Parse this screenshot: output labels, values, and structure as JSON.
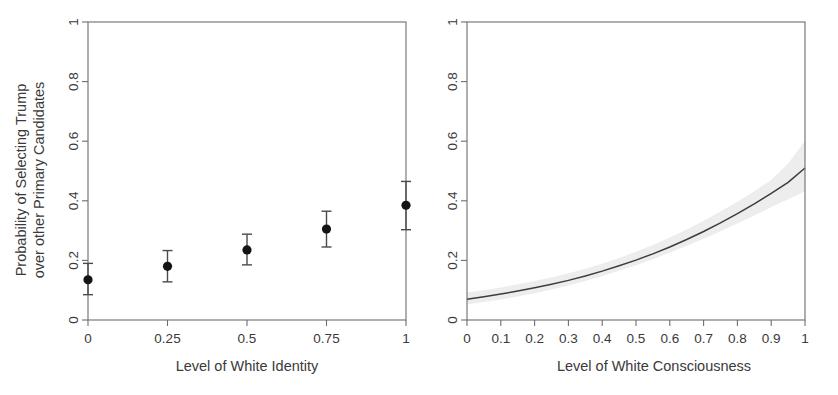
{
  "figure": {
    "panel_count": 2,
    "background_color": "#ffffff"
  },
  "chart_data": [
    {
      "id": "left-panel",
      "type": "scatter",
      "title": "",
      "xlabel": "Level of White Identity",
      "ylabel": "Probability of Selecting Trump over other Primary Candidates",
      "ylabel_line1": "Probability of Selecting Trump",
      "ylabel_line2": "over other Primary Candidates",
      "xlim": [
        0,
        1
      ],
      "ylim": [
        0,
        1
      ],
      "grid": false,
      "legend": "none",
      "xtick_labels": [
        "0",
        "0.25",
        "0.5",
        "0.75",
        "1"
      ],
      "xtick_values": [
        0,
        0.25,
        0.5,
        0.75,
        1
      ],
      "ytick_labels": [
        "0",
        "0.2",
        "0.4",
        "0.6",
        "0.8",
        "1"
      ],
      "ytick_values": [
        0,
        0.2,
        0.4,
        0.6,
        0.8,
        1
      ],
      "marker": "filled-circle",
      "marker_color": "#141414",
      "errorbar_color": "#4a4a4a",
      "x": [
        0,
        0.25,
        0.5,
        0.75,
        1
      ],
      "values": [
        0.135,
        0.18,
        0.235,
        0.305,
        0.385
      ],
      "ci_lower": [
        0.085,
        0.128,
        0.185,
        0.245,
        0.303
      ],
      "ci_upper": [
        0.19,
        0.233,
        0.288,
        0.365,
        0.465
      ]
    },
    {
      "id": "right-panel",
      "type": "line",
      "title": "",
      "xlabel": "Level of White Consciousness",
      "ylabel": "",
      "xlim": [
        0,
        1
      ],
      "ylim": [
        0,
        1
      ],
      "grid": false,
      "legend": "none",
      "xtick_labels": [
        "0",
        "0.1",
        "0.2",
        "0.3",
        "0.4",
        "0.5",
        "0.6",
        "0.7",
        "0.8",
        "0.9",
        "1"
      ],
      "xtick_values": [
        0,
        0.1,
        0.2,
        0.3,
        0.4,
        0.5,
        0.6,
        0.7,
        0.8,
        0.9,
        1
      ],
      "ytick_labels": [
        "0",
        "0.2",
        "0.4",
        "0.6",
        "0.8",
        "1"
      ],
      "ytick_values": [
        0,
        0.2,
        0.4,
        0.6,
        0.8,
        1
      ],
      "line_color": "#3d3d3d",
      "band_color": "#ededed",
      "x": [
        0,
        0.05,
        0.1,
        0.15,
        0.2,
        0.25,
        0.3,
        0.35,
        0.4,
        0.45,
        0.5,
        0.55,
        0.6,
        0.65,
        0.7,
        0.75,
        0.8,
        0.85,
        0.9,
        0.95,
        1
      ],
      "values": [
        0.07,
        0.078,
        0.087,
        0.097,
        0.108,
        0.12,
        0.133,
        0.148,
        0.164,
        0.182,
        0.201,
        0.222,
        0.245,
        0.27,
        0.297,
        0.326,
        0.357,
        0.39,
        0.425,
        0.462,
        0.51
      ],
      "ci_lower": [
        0.052,
        0.06,
        0.069,
        0.079,
        0.09,
        0.102,
        0.116,
        0.131,
        0.147,
        0.165,
        0.184,
        0.204,
        0.226,
        0.249,
        0.273,
        0.298,
        0.324,
        0.351,
        0.378,
        0.405,
        0.432
      ],
      "ci_upper": [
        0.092,
        0.1,
        0.109,
        0.12,
        0.131,
        0.143,
        0.157,
        0.172,
        0.189,
        0.208,
        0.229,
        0.252,
        0.277,
        0.304,
        0.333,
        0.364,
        0.397,
        0.432,
        0.47,
        0.525,
        0.601
      ]
    }
  ]
}
